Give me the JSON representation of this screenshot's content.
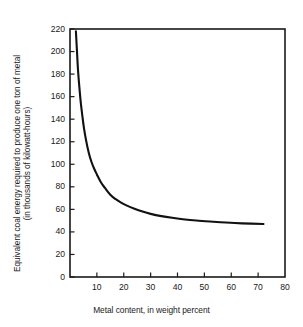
{
  "chart_data": {
    "type": "line",
    "title": "",
    "xlabel": "Metal content, in weight percent",
    "ylabel_lines": [
      "Equivalent coal energy required to produce one ton of metal",
      "(in thousands of kilowatt-hours)"
    ],
    "ylabel": "Equivalent coal energy required to produce one ton of metal (in thousands of kilowatt-hours)",
    "xlim": [
      0,
      80
    ],
    "ylim": [
      0,
      220
    ],
    "xticks": [
      0,
      10,
      20,
      30,
      40,
      50,
      60,
      70,
      80
    ],
    "xtick_labels": [
      "",
      "10",
      "20",
      "30",
      "40",
      "50",
      "60",
      "70",
      "80"
    ],
    "yticks": [
      0,
      20,
      40,
      60,
      80,
      100,
      120,
      140,
      160,
      180,
      200,
      220
    ],
    "ytick_labels": [
      "0",
      "20",
      "40",
      "60",
      "80",
      "100",
      "120",
      "140",
      "160",
      "180",
      "200",
      "220"
    ],
    "grid": false,
    "legend": false,
    "legend_position": "none",
    "tick_direction": "in",
    "frame": "box",
    "line_color": "#111111",
    "background_color": "#ffffff",
    "series": [
      {
        "name": "Equivalent coal energy",
        "x": [
          2.2,
          2.6,
          3.0,
          3.5,
          4.0,
          4.6,
          5.2,
          6.0,
          7.0,
          8.0,
          9.0,
          10.0,
          11.5,
          13.0,
          15.0,
          17.0,
          19.0,
          21.0,
          24.0,
          27.0,
          30.0,
          34.0,
          38.0,
          42.0,
          47.0,
          52.0,
          58.0,
          64.0,
          72.0
        ],
        "y": [
          218,
          200,
          183,
          168,
          155,
          143,
          132,
          121,
          110,
          102,
          96,
          91,
          84,
          79,
          73,
          69,
          66,
          63.5,
          60.5,
          58,
          56,
          54,
          52.5,
          51.3,
          50.1,
          49.2,
          48.3,
          47.6,
          47.0
        ]
      }
    ]
  }
}
